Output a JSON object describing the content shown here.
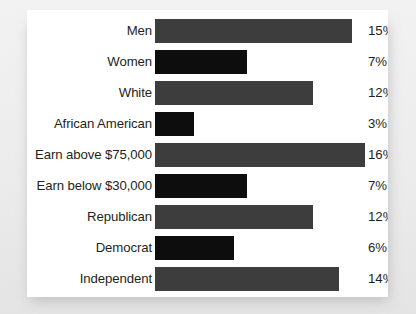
{
  "chart_data": {
    "type": "bar",
    "orientation": "horizontal",
    "title": "",
    "subtitle": "",
    "xlabel": "",
    "ylabel": "",
    "grid": false,
    "legend": null,
    "xlim": [
      0,
      16
    ],
    "value_suffix": "%",
    "categories": [
      "Men",
      "Women",
      "White",
      "African American",
      "Earn above $75,000",
      "Earn below $30,000",
      "Republican",
      "Democrat",
      "Independent"
    ],
    "values": [
      15,
      7,
      12,
      3,
      16,
      7,
      12,
      6,
      14
    ],
    "value_labels": [
      "15%",
      "7%",
      "12%",
      "3%",
      "16%",
      "7%",
      "12%",
      "6%",
      "14%"
    ],
    "bar_colors": [
      "#3d3d3d",
      "#0d0d0d",
      "#3d3d3d",
      "#0d0d0d",
      "#3d3d3d",
      "#0d0d0d",
      "#3d3d3d",
      "#0d0d0d",
      "#3d3d3d"
    ],
    "bar_color_names": [
      "gray",
      "black",
      "gray",
      "black",
      "gray",
      "black",
      "gray",
      "black",
      "gray"
    ]
  },
  "style": {
    "card_background": "#ffffff",
    "page_background": "#ececec",
    "text_color": "#231f20",
    "gray_bar": "#3d3d3d",
    "black_bar": "#0d0d0d"
  }
}
